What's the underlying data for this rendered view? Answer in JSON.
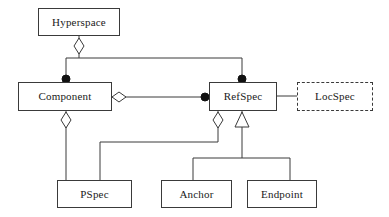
{
  "diagram": {
    "type": "uml-class-diagram",
    "width": 389,
    "height": 217,
    "background_color": "#ffffff",
    "line_color": "#3a3a3a",
    "text_color": "#1a1a1a",
    "classes": [
      {
        "id": "hyperspace",
        "name": "Hyperspace",
        "x": 38,
        "y": 8,
        "width": 82,
        "height": 28,
        "border": "solid"
      },
      {
        "id": "component",
        "name": "Component",
        "x": 18,
        "y": 82,
        "width": 94,
        "height": 29,
        "border": "solid"
      },
      {
        "id": "refspec",
        "name": "RefSpec",
        "x": 209,
        "y": 82,
        "width": 68,
        "height": 29,
        "border": "solid"
      },
      {
        "id": "locspec",
        "name": "LocSpec",
        "x": 297,
        "y": 82,
        "width": 76,
        "height": 29,
        "border": "dashed"
      },
      {
        "id": "pspec",
        "name": "PSpec",
        "x": 57,
        "y": 180,
        "width": 75,
        "height": 28,
        "border": "solid"
      },
      {
        "id": "anchor",
        "name": "Anchor",
        "x": 161,
        "y": 180,
        "width": 71,
        "height": 28,
        "border": "solid"
      },
      {
        "id": "endpoint",
        "name": "Endpoint",
        "x": 247,
        "y": 180,
        "width": 70,
        "height": 28,
        "border": "solid"
      }
    ],
    "relationships": [
      {
        "id": "hyperspace-component",
        "from": "hyperspace",
        "to": "component",
        "kind": "aggregation",
        "source_adornment": "hollow-diamond",
        "target_adornment": "filled-circle"
      },
      {
        "id": "hyperspace-refspec",
        "from": "hyperspace",
        "to": "refspec",
        "kind": "aggregation",
        "source_adornment": "hollow-diamond",
        "target_adornment": "filled-circle"
      },
      {
        "id": "component-refspec",
        "from": "component",
        "to": "refspec",
        "kind": "aggregation",
        "source_adornment": "hollow-diamond",
        "target_adornment": "filled-circle"
      },
      {
        "id": "refspec-locspec",
        "from": "refspec",
        "to": "locspec",
        "kind": "association",
        "source_adornment": "none",
        "target_adornment": "none"
      },
      {
        "id": "component-pspec",
        "from": "component",
        "to": "pspec",
        "kind": "aggregation",
        "source_adornment": "hollow-diamond",
        "target_adornment": "none"
      },
      {
        "id": "refspec-pspec",
        "from": "refspec",
        "to": "pspec",
        "kind": "aggregation",
        "source_adornment": "hollow-diamond",
        "target_adornment": "none"
      },
      {
        "id": "anchor-refspec",
        "from": "anchor",
        "to": "refspec",
        "kind": "generalization",
        "source_adornment": "none",
        "target_adornment": "hollow-triangle"
      },
      {
        "id": "endpoint-refspec",
        "from": "endpoint",
        "to": "refspec",
        "kind": "generalization",
        "source_adornment": "none",
        "target_adornment": "hollow-triangle"
      }
    ]
  }
}
